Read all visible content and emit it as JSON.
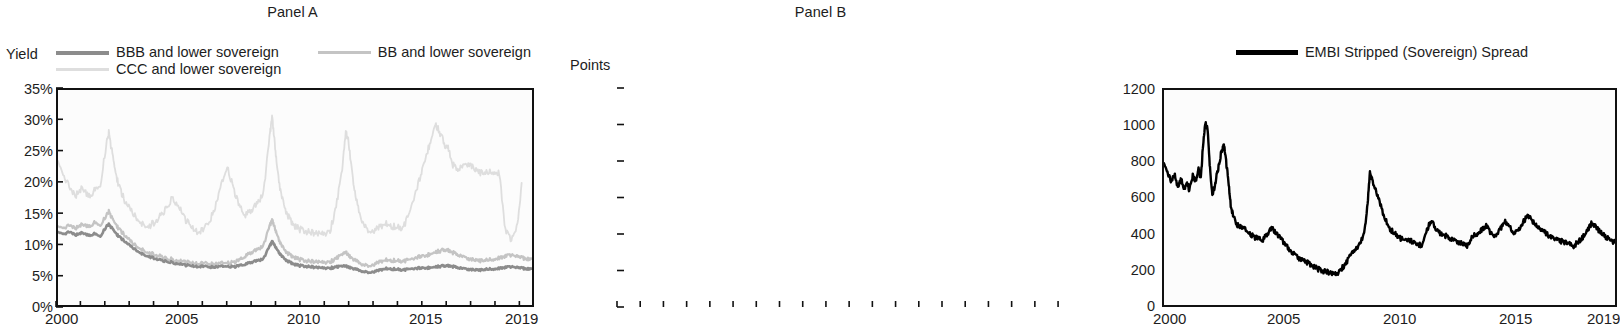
{
  "figure": {
    "panels": [
      {
        "id": "A",
        "title": "Panel A",
        "axis_unit": "Yield",
        "legend": [
          {
            "label": "BBB and lower sovereign",
            "color": "#8c8c8c"
          },
          {
            "label": "BB and lower sovereign",
            "color": "#c4c4c4"
          },
          {
            "label": "CCC and lower sovereign",
            "color": "#dedede"
          }
        ],
        "yticks": [
          "35%",
          "30%",
          "25%",
          "20%",
          "15%",
          "10%",
          "5%",
          "0%"
        ],
        "xticks": [
          "2000",
          "2005",
          "2010",
          "2015",
          "2019"
        ]
      },
      {
        "id": "B",
        "title": "Panel B",
        "axis_unit": "Points",
        "legend": [
          {
            "label": "EMBI Stripped (Sovereign) Spread",
            "color": "#000000"
          }
        ],
        "yticks": [
          "1200",
          "1000",
          "800",
          "600",
          "400",
          "200",
          "0"
        ],
        "xticks": [
          "2000",
          "2005",
          "2010",
          "2015",
          "2019"
        ]
      }
    ]
  },
  "chart_data": [
    {
      "type": "line",
      "title": "Panel A",
      "xlabel": "",
      "ylabel": "Yield",
      "xlim": [
        2000.0,
        2019.6
      ],
      "ylim": [
        0,
        35
      ],
      "ytick_values": [
        0,
        5,
        10,
        15,
        20,
        25,
        30,
        35
      ],
      "ytick_labels": [
        "0%",
        "5%",
        "10%",
        "15%",
        "20%",
        "25%",
        "30%",
        "35%"
      ],
      "xtick_values": [
        2000,
        2005,
        2010,
        2015,
        2019
      ],
      "xtick_labels": [
        "2000",
        "2005",
        "2010",
        "2015",
        "2019"
      ],
      "minor_xticks": "every year 2000-2019",
      "grid": false,
      "legend_position": "above-plot",
      "units": "percent yield",
      "x": [
        2000.0,
        2000.25,
        2000.5,
        2000.75,
        2001.0,
        2001.25,
        2001.5,
        2001.75,
        2002.0,
        2002.1,
        2002.25,
        2002.4,
        2002.55,
        2002.75,
        2003.0,
        2003.25,
        2003.5,
        2003.75,
        2004.0,
        2004.25,
        2004.5,
        2004.75,
        2005.0,
        2005.25,
        2005.5,
        2005.75,
        2006.0,
        2006.25,
        2006.5,
        2006.75,
        2007.0,
        2007.25,
        2007.5,
        2007.75,
        2008.0,
        2008.25,
        2008.5,
        2008.75,
        2008.85,
        2008.95,
        2009.05,
        2009.2,
        2009.4,
        2009.6,
        2009.8,
        2010.0,
        2010.25,
        2010.5,
        2010.75,
        2011.0,
        2011.25,
        2011.5,
        2011.75,
        2011.9,
        2012.0,
        2012.15,
        2012.3,
        2012.5,
        2012.75,
        2013.0,
        2013.25,
        2013.5,
        2013.75,
        2014.0,
        2014.25,
        2014.5,
        2014.75,
        2015.0,
        2015.2,
        2015.4,
        2015.6,
        2015.8,
        2016.0,
        2016.15,
        2016.3,
        2016.5,
        2016.75,
        2017.0,
        2017.25,
        2017.5,
        2017.75,
        2018.0,
        2018.25,
        2018.5,
        2018.75,
        2019.0,
        2019.2,
        2019.4,
        2019.6
      ],
      "series": [
        {
          "name": "BBB and lower sovereign",
          "color": "#8c8c8c",
          "values": [
            12.0,
            11.6,
            11.9,
            11.4,
            11.8,
            11.3,
            11.6,
            11.2,
            12.8,
            13.1,
            12.4,
            11.6,
            11.0,
            10.4,
            9.6,
            8.9,
            8.3,
            7.9,
            7.6,
            7.3,
            7.1,
            6.9,
            6.7,
            6.5,
            6.4,
            6.3,
            6.3,
            6.2,
            6.2,
            6.3,
            6.3,
            6.2,
            6.4,
            6.6,
            7.0,
            7.2,
            7.6,
            9.6,
            10.3,
            9.8,
            9.0,
            8.2,
            7.4,
            6.9,
            6.6,
            6.4,
            6.3,
            6.2,
            6.1,
            6.0,
            6.0,
            6.2,
            6.3,
            6.3,
            6.2,
            6.0,
            5.8,
            5.6,
            5.4,
            5.3,
            5.6,
            5.9,
            5.9,
            5.8,
            5.7,
            5.8,
            6.0,
            6.0,
            6.0,
            6.1,
            6.2,
            6.3,
            6.4,
            6.4,
            6.3,
            6.1,
            5.9,
            5.8,
            5.7,
            5.7,
            5.8,
            5.9,
            6.0,
            6.1,
            6.2,
            6.1,
            6.0,
            5.9,
            5.9
          ]
        },
        {
          "name": "BB and lower sovereign",
          "color": "#c4c4c4",
          "values": [
            13.0,
            12.6,
            13.0,
            12.5,
            13.2,
            12.7,
            13.4,
            13.0,
            14.6,
            15.2,
            14.0,
            13.0,
            12.2,
            11.4,
            10.4,
            9.6,
            9.0,
            8.5,
            8.2,
            7.9,
            7.6,
            7.4,
            7.2,
            7.0,
            6.9,
            6.8,
            6.8,
            6.7,
            6.7,
            6.8,
            6.9,
            6.9,
            7.3,
            7.9,
            8.6,
            9.0,
            9.8,
            12.9,
            13.8,
            12.8,
            11.4,
            10.0,
            8.8,
            8.1,
            7.7,
            7.4,
            7.2,
            7.1,
            7.0,
            6.9,
            7.0,
            7.6,
            8.2,
            8.5,
            8.2,
            7.6,
            7.2,
            6.8,
            6.5,
            6.4,
            6.9,
            7.3,
            7.3,
            7.2,
            7.1,
            7.3,
            7.7,
            7.9,
            8.0,
            8.3,
            8.6,
            8.8,
            9.0,
            8.9,
            8.6,
            8.2,
            7.8,
            7.5,
            7.3,
            7.2,
            7.3,
            7.5,
            7.7,
            7.9,
            8.1,
            7.9,
            7.7,
            7.5,
            7.5
          ]
        },
        {
          "name": "CCC and lower sovereign",
          "color": "#dedede",
          "values": [
            23.8,
            21.0,
            19.0,
            17.8,
            19.2,
            17.6,
            18.6,
            19.5,
            26.2,
            28.0,
            24.5,
            21.0,
            19.0,
            17.0,
            15.5,
            14.2,
            13.2,
            12.8,
            13.5,
            14.5,
            16.0,
            17.5,
            16.0,
            14.0,
            12.8,
            12.0,
            12.2,
            13.5,
            16.0,
            19.5,
            22.5,
            19.0,
            16.0,
            14.5,
            15.5,
            16.5,
            18.5,
            27.5,
            30.5,
            27.0,
            22.5,
            18.5,
            15.5,
            13.8,
            12.8,
            12.3,
            12.0,
            11.8,
            11.6,
            11.5,
            12.0,
            16.0,
            22.0,
            28.0,
            27.0,
            22.0,
            17.5,
            14.5,
            12.5,
            11.8,
            12.5,
            13.2,
            13.0,
            12.6,
            12.5,
            14.5,
            18.0,
            21.0,
            24.0,
            26.5,
            29.5,
            28.0,
            26.0,
            25.5,
            23.0,
            22.0,
            22.5,
            23.0,
            22.0,
            21.5,
            21.5,
            21.8,
            21.5,
            12.0,
            10.5,
            13.0,
            20.5
          ]
        }
      ]
    },
    {
      "type": "line",
      "title": "Panel B",
      "xlabel": "",
      "ylabel": "Points",
      "xlim": [
        2000.0,
        2019.6
      ],
      "ylim": [
        0,
        1200
      ],
      "ytick_values": [
        0,
        200,
        400,
        600,
        800,
        1000,
        1200
      ],
      "ytick_labels": [
        "0",
        "200",
        "400",
        "600",
        "800",
        "1000",
        "1200"
      ],
      "xtick_values": [
        2000,
        2005,
        2010,
        2015,
        2019
      ],
      "xtick_labels": [
        "2000",
        "2005",
        "2010",
        "2015",
        "2019"
      ],
      "minor_xticks": "every year 2000-2019",
      "grid": false,
      "legend_position": "above-plot",
      "units": "basis points",
      "x": [
        2000.0,
        2000.15,
        2000.3,
        2000.45,
        2000.6,
        2000.75,
        2000.9,
        2001.0,
        2001.1,
        2001.25,
        2001.4,
        2001.5,
        2001.6,
        2001.7,
        2001.8,
        2001.9,
        2002.0,
        2002.1,
        2002.2,
        2002.3,
        2002.4,
        2002.5,
        2002.6,
        2002.7,
        2002.8,
        2002.9,
        2003.0,
        2003.15,
        2003.3,
        2003.5,
        2003.7,
        2003.9,
        2004.1,
        2004.3,
        2004.5,
        2004.7,
        2004.9,
        2005.1,
        2005.3,
        2005.5,
        2005.7,
        2005.9,
        2006.1,
        2006.3,
        2006.5,
        2006.7,
        2006.9,
        2007.1,
        2007.3,
        2007.5,
        2007.7,
        2007.9,
        2008.1,
        2008.3,
        2008.5,
        2008.7,
        2008.85,
        2008.95,
        2009.05,
        2009.2,
        2009.4,
        2009.6,
        2009.8,
        2010.0,
        2010.2,
        2010.4,
        2010.6,
        2010.8,
        2011.0,
        2011.2,
        2011.4,
        2011.6,
        2011.8,
        2012.0,
        2012.2,
        2012.4,
        2012.6,
        2012.8,
        2013.0,
        2013.2,
        2013.4,
        2013.6,
        2013.8,
        2014.0,
        2014.2,
        2014.4,
        2014.6,
        2014.8,
        2015.0,
        2015.2,
        2015.4,
        2015.6,
        2015.8,
        2016.0,
        2016.2,
        2016.4,
        2016.6,
        2016.8,
        2017.0,
        2017.2,
        2017.4,
        2017.6,
        2017.8,
        2018.0,
        2018.2,
        2018.4,
        2018.6,
        2018.8,
        2019.0,
        2019.2,
        2019.4,
        2019.6
      ],
      "series": [
        {
          "name": "EMBI Stripped (Sovereign) Spread",
          "color": "#000000",
          "values": [
            800,
            745,
            690,
            730,
            660,
            700,
            645,
            690,
            640,
            720,
            690,
            760,
            700,
            900,
            1015,
            980,
            760,
            620,
            660,
            730,
            790,
            860,
            900,
            800,
            690,
            560,
            500,
            450,
            440,
            425,
            400,
            380,
            370,
            360,
            400,
            430,
            400,
            370,
            330,
            300,
            280,
            255,
            250,
            230,
            215,
            200,
            190,
            185,
            175,
            170,
            200,
            230,
            280,
            300,
            340,
            400,
            560,
            745,
            700,
            640,
            560,
            480,
            430,
            400,
            380,
            360,
            370,
            350,
            340,
            330,
            410,
            470,
            430,
            400,
            390,
            370,
            360,
            350,
            340,
            330,
            380,
            400,
            420,
            440,
            400,
            380,
            420,
            470,
            440,
            400,
            420,
            460,
            500,
            470,
            440,
            420,
            400,
            380,
            370,
            360,
            350,
            340,
            330,
            350,
            380,
            420,
            460,
            430,
            400,
            380,
            360,
            350
          ]
        }
      ]
    }
  ]
}
